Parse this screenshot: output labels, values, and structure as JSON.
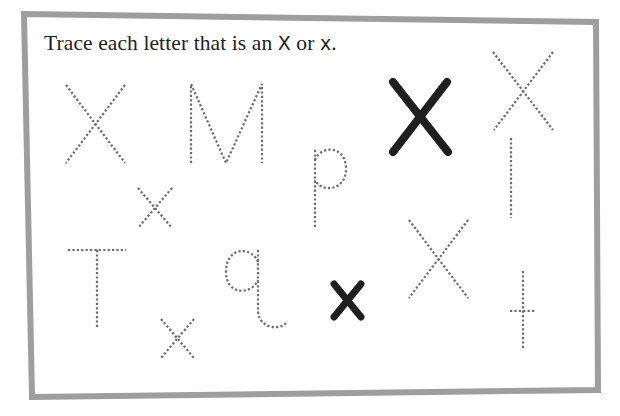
{
  "worksheet": {
    "instruction": {
      "prefix": "Trace each letter that is an ",
      "upper_x": "X",
      "middle": " or ",
      "lower_x": "x",
      "suffix": "."
    },
    "frame_color": "#9e9e9e",
    "trace_color": "#6b6b6b",
    "solid_color": "#1f1f1f",
    "letters": [
      {
        "id": "letter-1",
        "char": "X",
        "style": "dotted",
        "is_target": true
      },
      {
        "id": "letter-2",
        "char": "M",
        "style": "dotted",
        "is_target": false
      },
      {
        "id": "letter-3",
        "char": "p",
        "style": "dotted",
        "is_target": false
      },
      {
        "id": "letter-4",
        "char": "X",
        "style": "solid-traced",
        "is_target": true
      },
      {
        "id": "letter-5",
        "char": "X",
        "style": "dotted",
        "is_target": true
      },
      {
        "id": "letter-6",
        "char": "x",
        "style": "dotted",
        "is_target": true
      },
      {
        "id": "letter-7",
        "char": "l",
        "style": "dotted",
        "is_target": false
      },
      {
        "id": "letter-8",
        "char": "T",
        "style": "dotted",
        "is_target": false
      },
      {
        "id": "letter-9",
        "char": "q",
        "style": "dotted",
        "is_target": false
      },
      {
        "id": "letter-10",
        "char": "x",
        "style": "solid-traced",
        "is_target": true
      },
      {
        "id": "letter-11",
        "char": "X",
        "style": "dotted",
        "is_target": true
      },
      {
        "id": "letter-12",
        "char": "t",
        "style": "dotted",
        "is_target": false
      },
      {
        "id": "letter-13",
        "char": "x",
        "style": "dotted",
        "is_target": true
      }
    ]
  }
}
